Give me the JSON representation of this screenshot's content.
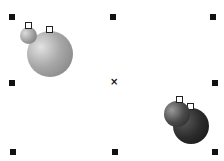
{
  "canvas": {
    "center_marker": "×",
    "selection_handles": [
      "top-left",
      "top-middle",
      "top-right",
      "middle-left",
      "middle-right",
      "bottom-left",
      "bottom-middle",
      "bottom-right"
    ],
    "objects": [
      {
        "name": "light-ornament-pair",
        "color": "#a9a9a9"
      },
      {
        "name": "dark-ornament-pair",
        "color": "#2a2a2a"
      }
    ]
  }
}
